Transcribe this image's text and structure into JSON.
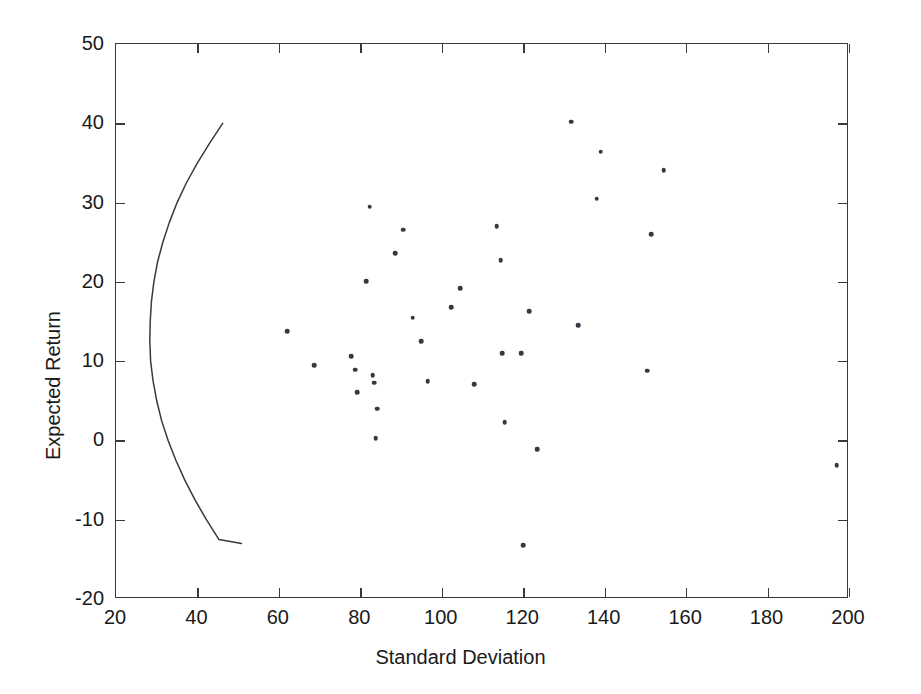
{
  "chart_data": {
    "type": "scatter",
    "title": "",
    "subtitle": "",
    "xlabel": "Standard Deviation",
    "ylabel": "Expected Return",
    "xlim": [
      20,
      200
    ],
    "ylim": [
      -20,
      50
    ],
    "xticks": [
      20,
      40,
      60,
      80,
      100,
      120,
      140,
      160,
      180,
      200
    ],
    "yticks": [
      -20,
      -10,
      0,
      10,
      20,
      30,
      40,
      50
    ],
    "xtick_labels": [
      "20",
      "40",
      "60",
      "80",
      "100",
      "120",
      "140",
      "160",
      "180",
      "200"
    ],
    "ytick_labels": [
      "-20",
      "-10",
      "0",
      "10",
      "20",
      "30",
      "40",
      "50"
    ],
    "grid": false,
    "legend": false,
    "legend_position": "none",
    "marker_color": "#333a44",
    "line_color": "#3a3a3a",
    "axis_color": "#3a3a3a",
    "background": "#ffffff",
    "series": [
      {
        "name": "Individual Assets",
        "type": "scatter",
        "marker": "dot",
        "points": [
          {
            "x": 62.0,
            "y": 13.8
          },
          {
            "x": 68.6,
            "y": 9.5
          },
          {
            "x": 77.7,
            "y": 10.6
          },
          {
            "x": 78.8,
            "y": 8.9
          },
          {
            "x": 79.2,
            "y": 6.1
          },
          {
            "x": 81.4,
            "y": 20.1
          },
          {
            "x": 82.3,
            "y": 29.5
          },
          {
            "x": 83.0,
            "y": 8.2
          },
          {
            "x": 83.4,
            "y": 7.3
          },
          {
            "x": 83.8,
            "y": 0.3
          },
          {
            "x": 84.2,
            "y": 4.0
          },
          {
            "x": 88.5,
            "y": 23.6
          },
          {
            "x": 90.5,
            "y": 26.6
          },
          {
            "x": 92.9,
            "y": 15.5
          },
          {
            "x": 95.0,
            "y": 12.5
          },
          {
            "x": 96.5,
            "y": 7.5
          },
          {
            "x": 102.3,
            "y": 16.8
          },
          {
            "x": 104.5,
            "y": 19.2
          },
          {
            "x": 108.0,
            "y": 7.1
          },
          {
            "x": 113.5,
            "y": 27.0
          },
          {
            "x": 114.5,
            "y": 22.7
          },
          {
            "x": 114.8,
            "y": 11.0
          },
          {
            "x": 115.5,
            "y": 2.3
          },
          {
            "x": 119.5,
            "y": 11.0
          },
          {
            "x": 120.0,
            "y": -13.2
          },
          {
            "x": 121.5,
            "y": 16.3
          },
          {
            "x": 123.5,
            "y": -1.1
          },
          {
            "x": 131.8,
            "y": 40.2
          },
          {
            "x": 133.5,
            "y": 14.5
          },
          {
            "x": 138.0,
            "y": 30.5
          },
          {
            "x": 139.0,
            "y": 36.4
          },
          {
            "x": 150.5,
            "y": 8.8
          },
          {
            "x": 151.5,
            "y": 26.0
          },
          {
            "x": 154.5,
            "y": 34.1
          },
          {
            "x": 197.0,
            "y": -3.1
          }
        ]
      },
      {
        "name": "Efficient Frontier",
        "type": "line",
        "points": [
          {
            "x": 46.2,
            "y": 40.0
          },
          {
            "x": 43.0,
            "y": 37.5
          },
          {
            "x": 40.0,
            "y": 35.0
          },
          {
            "x": 37.3,
            "y": 32.5
          },
          {
            "x": 35.0,
            "y": 30.0
          },
          {
            "x": 33.1,
            "y": 27.5
          },
          {
            "x": 31.5,
            "y": 25.0
          },
          {
            "x": 30.2,
            "y": 22.5
          },
          {
            "x": 29.3,
            "y": 20.0
          },
          {
            "x": 28.7,
            "y": 17.5
          },
          {
            "x": 28.4,
            "y": 15.0
          },
          {
            "x": 28.3,
            "y": 12.5
          },
          {
            "x": 28.5,
            "y": 10.0
          },
          {
            "x": 29.1,
            "y": 7.5
          },
          {
            "x": 30.0,
            "y": 5.0
          },
          {
            "x": 31.2,
            "y": 2.5
          },
          {
            "x": 32.8,
            "y": 0.0
          },
          {
            "x": 34.7,
            "y": -2.5
          },
          {
            "x": 36.9,
            "y": -5.0
          },
          {
            "x": 39.4,
            "y": -7.5
          },
          {
            "x": 42.2,
            "y": -10.0
          },
          {
            "x": 45.3,
            "y": -12.5
          },
          {
            "x": 50.8,
            "y": -13.0
          }
        ]
      }
    ]
  }
}
